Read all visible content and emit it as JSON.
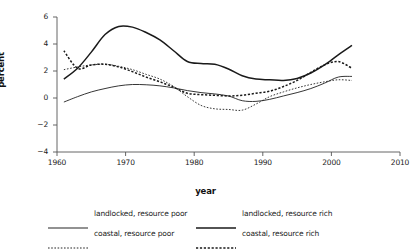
{
  "chart_data": {
    "type": "line",
    "title": "",
    "xlabel": "year",
    "ylabel": "percent",
    "xlim": [
      1960,
      2010
    ],
    "ylim": [
      -4,
      6
    ],
    "xticks": [
      1960,
      1970,
      1980,
      1990,
      2000,
      2010
    ],
    "yticks": [
      6,
      4,
      2,
      0,
      -2,
      -4
    ],
    "grid": false,
    "legend_position": "below-plot",
    "series": [
      {
        "name": "landlocked, resource poor",
        "style": "solid",
        "width": "thin",
        "color": "#2b2b2b",
        "x": [
          1961,
          1963,
          1965,
          1967,
          1969,
          1971,
          1973,
          1975,
          1977,
          1979,
          1981,
          1983,
          1985,
          1987,
          1989,
          1991,
          1993,
          1995,
          1997,
          1999,
          2001,
          2003
        ],
        "y": [
          -0.3,
          0.1,
          0.45,
          0.7,
          0.9,
          1.0,
          0.98,
          0.9,
          0.75,
          0.55,
          0.4,
          0.3,
          0.15,
          -0.2,
          -0.25,
          -0.1,
          0.15,
          0.4,
          0.7,
          1.1,
          1.55,
          1.6
        ]
      },
      {
        "name": "landlocked, resource rich",
        "style": "solid",
        "width": "thick",
        "color": "#1a1a1a",
        "x": [
          1961,
          1963,
          1965,
          1967,
          1969,
          1971,
          1973,
          1975,
          1977,
          1979,
          1981,
          1983,
          1985,
          1987,
          1989,
          1991,
          1993,
          1995,
          1997,
          1999,
          2001,
          2003
        ],
        "y": [
          1.4,
          2.2,
          3.4,
          4.7,
          5.3,
          5.25,
          4.85,
          4.3,
          3.5,
          2.7,
          2.55,
          2.5,
          2.15,
          1.65,
          1.4,
          1.35,
          1.3,
          1.45,
          1.85,
          2.45,
          3.2,
          3.9
        ]
      },
      {
        "name": "coastal, resource poor",
        "style": "dotted",
        "width": "thin",
        "color": "#2b2b2b",
        "x": [
          1961,
          1963,
          1965,
          1967,
          1969,
          1971,
          1973,
          1975,
          1977,
          1979,
          1981,
          1983,
          1985,
          1987,
          1989,
          1991,
          1993,
          1995,
          1997,
          1999,
          2001,
          2003
        ],
        "y": [
          2.1,
          2.3,
          2.45,
          2.5,
          2.35,
          2.1,
          1.75,
          1.4,
          0.85,
          0.1,
          -0.55,
          -0.8,
          -0.85,
          -0.9,
          -0.45,
          0.1,
          0.45,
          0.75,
          1.0,
          1.2,
          1.35,
          1.3
        ]
      },
      {
        "name": "coastal, resource rich",
        "style": "dotted",
        "width": "thick",
        "color": "#1a1a1a",
        "x": [
          1961,
          1963,
          1965,
          1967,
          1969,
          1971,
          1973,
          1975,
          1977,
          1979,
          1981,
          1983,
          1985,
          1987,
          1989,
          1991,
          1993,
          1995,
          1997,
          1999,
          2001,
          2003
        ],
        "y": [
          3.5,
          2.2,
          2.45,
          2.5,
          2.3,
          1.95,
          1.55,
          1.2,
          0.8,
          0.35,
          0.25,
          0.2,
          0.15,
          0.2,
          0.35,
          0.5,
          0.85,
          1.3,
          1.9,
          2.45,
          2.7,
          2.2
        ]
      }
    ]
  },
  "axis": {
    "y_title": "percent",
    "x_title": "year",
    "y_tick_labels": [
      "6",
      "4",
      "2",
      "0",
      "−2",
      "−4"
    ],
    "x_tick_labels": [
      "1960",
      "1970",
      "1980",
      "1990",
      "2000",
      "2010"
    ]
  },
  "legend": {
    "entries": [
      {
        "label": "landlocked, resource poor",
        "style": "solid",
        "width": "thin"
      },
      {
        "label": "landlocked, resource rich",
        "style": "solid",
        "width": "thick"
      },
      {
        "label": "coastal, resource poor",
        "style": "dotted",
        "width": "thin"
      },
      {
        "label": "coastal, resource rich",
        "style": "dotted",
        "width": "thick"
      }
    ]
  },
  "colors": {
    "ink": "#1a1a1a",
    "axis": "#555555",
    "background": "#ffffff"
  }
}
